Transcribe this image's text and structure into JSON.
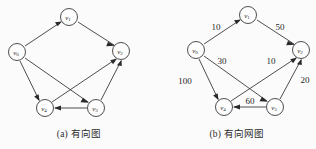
{
  "figure": {
    "background_color": "#fbfbfb",
    "stroke_color": "#3a3a3a",
    "text_color": "#2b2b2b"
  },
  "panels": [
    {
      "id": "a",
      "caption": "(a) 有向图",
      "nodes": [
        {
          "id": "v0",
          "label": "v",
          "sub": "0",
          "x": 17,
          "y": 52
        },
        {
          "id": "v1",
          "label": "v",
          "sub": "1",
          "x": 69,
          "y": 17
        },
        {
          "id": "v2",
          "label": "v",
          "sub": "2",
          "x": 121,
          "y": 51
        },
        {
          "id": "v3",
          "label": "v",
          "sub": "3",
          "x": 96,
          "y": 108
        },
        {
          "id": "v4",
          "label": "v",
          "sub": "4",
          "x": 45,
          "y": 108
        }
      ],
      "edges": [
        {
          "from": "v0",
          "to": "v1",
          "weight": ""
        },
        {
          "from": "v1",
          "to": "v2",
          "weight": ""
        },
        {
          "from": "v0",
          "to": "v3",
          "weight": ""
        },
        {
          "from": "v0",
          "to": "v4",
          "weight": ""
        },
        {
          "from": "v4",
          "to": "v2",
          "weight": ""
        },
        {
          "from": "v3",
          "to": "v2",
          "weight": ""
        },
        {
          "from": "v3",
          "to": "v4",
          "weight": ""
        }
      ]
    },
    {
      "id": "b",
      "caption": "(b) 有向网图",
      "nodes": [
        {
          "id": "v0",
          "label": "v",
          "sub": "0",
          "x": 38,
          "y": 50
        },
        {
          "id": "v1",
          "label": "v",
          "sub": "1",
          "x": 90,
          "y": 15
        },
        {
          "id": "v2",
          "label": "v",
          "sub": "2",
          "x": 143,
          "y": 50
        },
        {
          "id": "v3",
          "label": "v",
          "sub": "3",
          "x": 117,
          "y": 107
        },
        {
          "id": "v4",
          "label": "v",
          "sub": "4",
          "x": 66,
          "y": 107
        }
      ],
      "edges": [
        {
          "from": "v0",
          "to": "v1",
          "weight": "10",
          "lx": 58,
          "ly": 27
        },
        {
          "from": "v1",
          "to": "v2",
          "weight": "50",
          "lx": 122,
          "ly": 27
        },
        {
          "from": "v0",
          "to": "v3",
          "weight": "30",
          "lx": 64,
          "ly": 61
        },
        {
          "from": "v0",
          "to": "v4",
          "weight": "100",
          "lx": 27,
          "ly": 81
        },
        {
          "from": "v4",
          "to": "v2",
          "weight": "10",
          "lx": 113,
          "ly": 61
        },
        {
          "from": "v3",
          "to": "v2",
          "weight": "20",
          "lx": 147,
          "ly": 80
        },
        {
          "from": "v3",
          "to": "v4",
          "weight": "60",
          "lx": 92,
          "ly": 101
        }
      ]
    }
  ]
}
